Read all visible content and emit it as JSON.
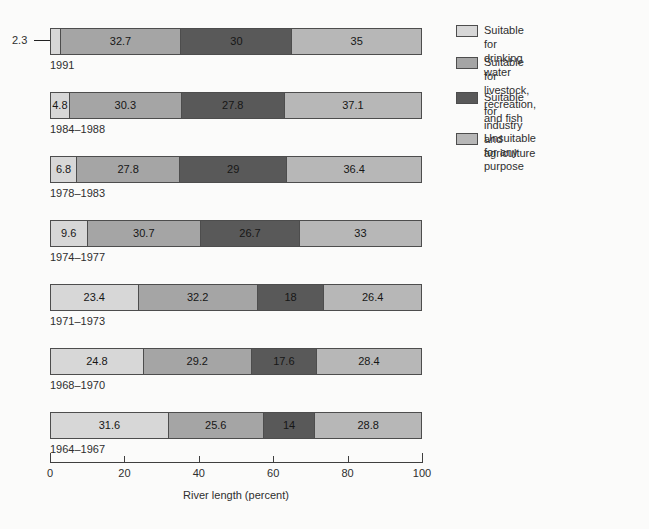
{
  "chart_data": {
    "type": "bar",
    "orientation": "horizontal",
    "stacked": true,
    "xlabel": "River length (percent)",
    "xlim": [
      0,
      100
    ],
    "x_ticks": [
      0,
      20,
      40,
      60,
      80,
      100
    ],
    "legend_position": "right",
    "categories": [
      "1991",
      "1984–1988",
      "1978–1983",
      "1974–1977",
      "1971–1973",
      "1968–1970",
      "1964–1967"
    ],
    "series": [
      {
        "name": "Suitable for drinking water",
        "color": "#d7d7d7",
        "values": [
          2.3,
          4.8,
          6.8,
          9.6,
          23.4,
          24.8,
          31.6
        ]
      },
      {
        "name": "Suitable for livestock, recreation, and fish",
        "color": "#a5a5a5",
        "values": [
          32.7,
          30.3,
          27.8,
          30.7,
          32.2,
          29.2,
          25.6
        ]
      },
      {
        "name": "Suitable for industry and agriculture",
        "color": "#595959",
        "values": [
          30,
          27.8,
          29,
          26.7,
          18,
          17.6,
          14
        ]
      },
      {
        "name": "Unsuitable for any purpose",
        "color": "#b7b7b7",
        "values": [
          35,
          37.1,
          36.4,
          33,
          26.4,
          28.4,
          28.8
        ]
      }
    ],
    "callout": {
      "category": "1991",
      "series_index": 0,
      "label": "2.3"
    }
  }
}
